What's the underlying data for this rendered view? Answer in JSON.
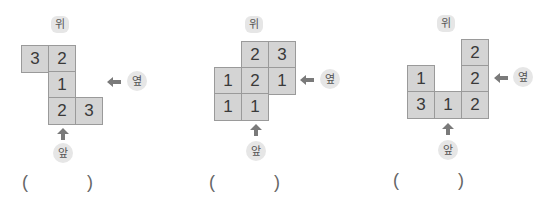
{
  "labels": {
    "top": "위",
    "side": "옆",
    "front": "앞"
  },
  "problems": [
    {
      "cells": [
        {
          "col": 0,
          "row": 0,
          "value": "3"
        },
        {
          "col": 1,
          "row": 0,
          "value": "2"
        },
        {
          "col": 1,
          "row": 1,
          "value": "1"
        },
        {
          "col": 1,
          "row": 2,
          "value": "2"
        },
        {
          "col": 2,
          "row": 2,
          "value": "3"
        }
      ],
      "answer": {
        "open": "(",
        "close": ")",
        "value": ""
      }
    },
    {
      "cells": [
        {
          "col": 1,
          "row": 0,
          "value": "2"
        },
        {
          "col": 2,
          "row": 0,
          "value": "3"
        },
        {
          "col": 0,
          "row": 1,
          "value": "1"
        },
        {
          "col": 1,
          "row": 1,
          "value": "2"
        },
        {
          "col": 2,
          "row": 1,
          "value": "1"
        },
        {
          "col": 0,
          "row": 2,
          "value": "1"
        },
        {
          "col": 1,
          "row": 2,
          "value": "1"
        }
      ],
      "answer": {
        "open": "(",
        "close": ")",
        "value": ""
      }
    },
    {
      "cells": [
        {
          "col": 2,
          "row": 0,
          "value": "2"
        },
        {
          "col": 0,
          "row": 1,
          "value": "1"
        },
        {
          "col": 2,
          "row": 1,
          "value": "2"
        },
        {
          "col": 0,
          "row": 2,
          "value": "3"
        },
        {
          "col": 1,
          "row": 2,
          "value": "1"
        },
        {
          "col": 2,
          "row": 2,
          "value": "2"
        }
      ],
      "answer": {
        "open": "(",
        "close": ")",
        "value": ""
      }
    }
  ],
  "p1": {
    "c0": "3",
    "c1": "2",
    "c2": "1",
    "c3": "2",
    "c4": "3"
  },
  "p2": {
    "c0": "2",
    "c1": "3",
    "c2": "1",
    "c3": "2",
    "c4": "1",
    "c5": "1",
    "c6": "1"
  },
  "p3": {
    "c0": "2",
    "c1": "1",
    "c2": "2",
    "c3": "3",
    "c4": "1",
    "c5": "2"
  },
  "colors": {
    "cell_fill": "#d4d4d4",
    "cell_border": "#9a9a9a",
    "arrow": "#7a7a7a",
    "label_bg": "#e6e6e6"
  }
}
